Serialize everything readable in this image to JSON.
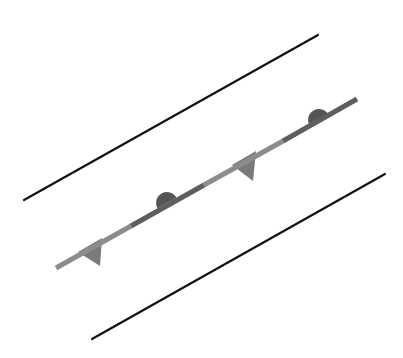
{
  "diagram": {
    "type": "weather-front-symbol",
    "background": "#ffffff",
    "boundary_lines": [
      {
        "name": "upper-boundary-line",
        "x1": 24,
        "y1": 200,
        "x2": 318,
        "y2": 35,
        "color": "#111111",
        "width": 2.2
      },
      {
        "name": "lower-boundary-line",
        "x1": 92,
        "y1": 339,
        "x2": 385,
        "y2": 174,
        "color": "#111111",
        "width": 2.2
      }
    ],
    "front": {
      "x1": 56,
      "y1": 268,
      "x2": 357,
      "y2": 99,
      "width": 5,
      "segments": [
        {
          "x1": 56,
          "y1": 268,
          "x2": 131,
          "y2": 226,
          "color": "#8c8c8c"
        },
        {
          "x1": 131,
          "y1": 226,
          "x2": 204,
          "y2": 185,
          "color": "#5e5e5e"
        },
        {
          "x1": 204,
          "y1": 185,
          "x2": 283,
          "y2": 141,
          "color": "#8c8c8c"
        },
        {
          "x1": 283,
          "y1": 141,
          "x2": 357,
          "y2": 99,
          "color": "#5e5e5e"
        }
      ],
      "triangles": [
        {
          "points": "78,252 102,238 100,266",
          "color": "#7a7a7a"
        },
        {
          "points": "232,165 256,151 253,181",
          "color": "#7a7a7a"
        }
      ],
      "semicircles": [
        {
          "cx": 167,
          "cy": 203,
          "r": 11,
          "angle": -29.3,
          "color": "#555555"
        },
        {
          "cx": 319,
          "cy": 120,
          "r": 11,
          "angle": -29.3,
          "color": "#555555"
        }
      ]
    }
  }
}
